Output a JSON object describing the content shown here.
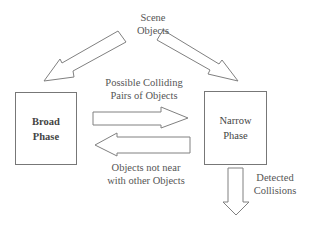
{
  "diagram": {
    "nodes": [
      {
        "id": "broad",
        "label": "Broad\nPhase"
      },
      {
        "id": "narrow",
        "label": "Narrow\nPhase"
      }
    ],
    "labels": {
      "scene_objects": "Scene\nObjects",
      "possible_pairs": "Possible Colliding\nPairs of Objects",
      "objects_not_near": "Objects not near\nwith other Objects",
      "detected_collisions": "Detected\nCollisions"
    },
    "edges": [
      {
        "from": "scene_objects",
        "to": "broad",
        "label": ""
      },
      {
        "from": "scene_objects",
        "to": "narrow",
        "label": ""
      },
      {
        "from": "broad",
        "to": "narrow",
        "label": "Possible Colliding Pairs of Objects"
      },
      {
        "from": "narrow",
        "to": "broad",
        "label": "Objects not near with other Objects"
      },
      {
        "from": "narrow",
        "to": "output",
        "label": "Detected Collisions"
      }
    ],
    "colors": {
      "stroke": "#777777",
      "fill": "#ffffff",
      "text": "#444444"
    }
  }
}
